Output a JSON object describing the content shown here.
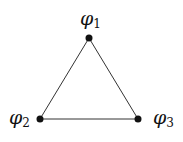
{
  "diagram": {
    "type": "graph",
    "nodes": [
      {
        "id": "n1",
        "symbol": "φ",
        "subscript": "1",
        "x": 89,
        "y": 38
      },
      {
        "id": "n2",
        "symbol": "φ",
        "subscript": "2",
        "x": 40,
        "y": 119
      },
      {
        "id": "n3",
        "symbol": "φ",
        "subscript": "3",
        "x": 138,
        "y": 119
      }
    ],
    "edges": [
      {
        "from": "n1",
        "to": "n2"
      },
      {
        "from": "n1",
        "to": "n3"
      },
      {
        "from": "n2",
        "to": "n3"
      }
    ],
    "colors": {
      "line": "#333333",
      "node": "#111111"
    }
  }
}
